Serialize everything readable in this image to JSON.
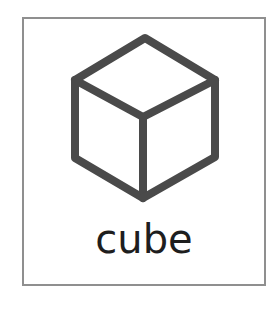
{
  "card": {
    "word": "cube",
    "image": "cube-drawing",
    "colors": {
      "border": "#8f8f8f",
      "stroke": "#4a4a4a",
      "text": "#1e1e1e",
      "background": "#ffffff"
    }
  }
}
